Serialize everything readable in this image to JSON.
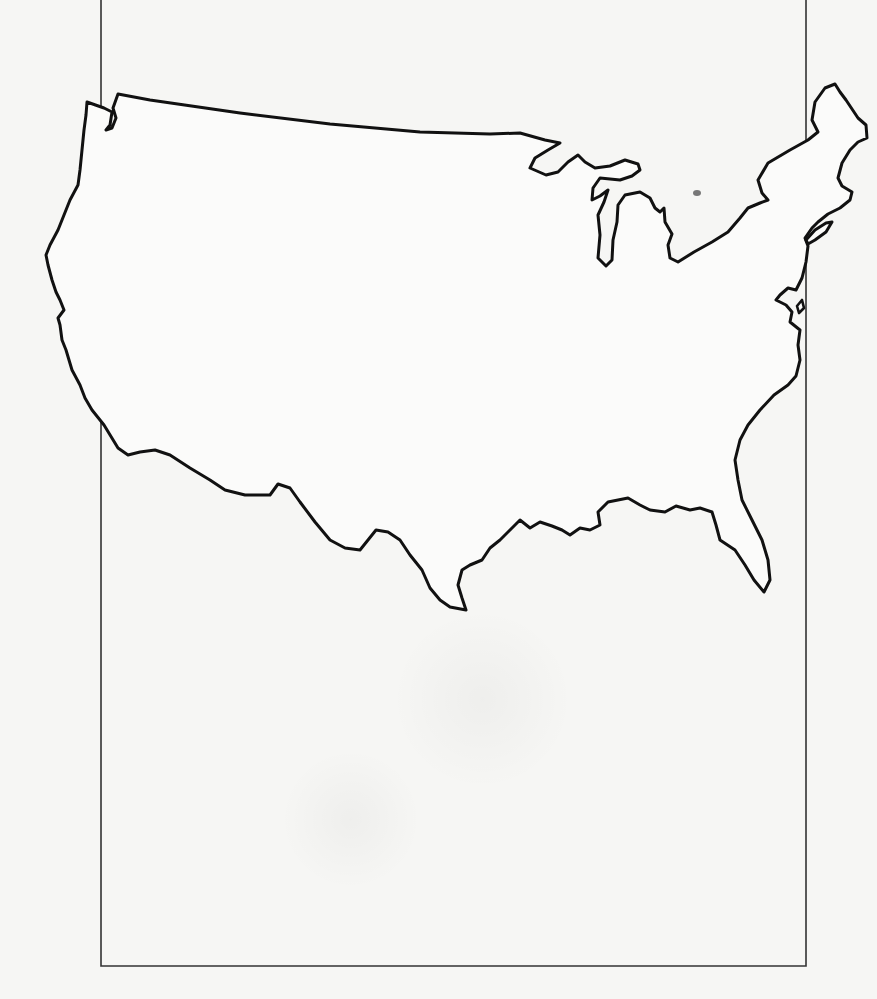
{
  "map": {
    "subject": "Outline map of the contiguous United States",
    "style": "blank outline, no labels",
    "colors": {
      "background": "#f6f6f4",
      "outline": "#111111",
      "frame": "#333333"
    },
    "frame": {
      "left": 100,
      "right": 806,
      "top": 0,
      "bottom": 966
    },
    "labels": []
  }
}
